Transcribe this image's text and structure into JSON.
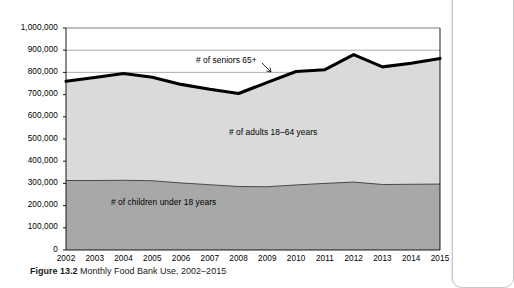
{
  "figure": {
    "caption_label": "Figure 13.2",
    "caption_text": "Monthly Food Bank Use, 2002–2015"
  },
  "chart_data": {
    "type": "area",
    "title": "",
    "xlabel": "",
    "ylabel": "",
    "categories": [
      "2002",
      "2003",
      "2004",
      "2005",
      "2006",
      "2007",
      "2008",
      "2009",
      "2010",
      "2011",
      "2012",
      "2013",
      "2014",
      "2015"
    ],
    "ylim": [
      0,
      1000000
    ],
    "ytick_labels": [
      "0",
      "100,000",
      "200,000",
      "300,000",
      "400,000",
      "500,000",
      "600,000",
      "700,000",
      "800,000",
      "900,000",
      "1,000,000"
    ],
    "ytick_values": [
      0,
      100000,
      200000,
      300000,
      400000,
      500000,
      600000,
      700000,
      800000,
      900000,
      1000000
    ],
    "grid": "horizontal",
    "legend_position": "inline-annotations",
    "stacked": true,
    "series": [
      {
        "name": "# of children under 18 years",
        "color": "#a8a8a8",
        "values": [
          313000,
          313000,
          314000,
          312000,
          302000,
          294000,
          286000,
          285000,
          293000,
          300000,
          306000,
          295000,
          296000,
          297000
        ]
      },
      {
        "name": "# of adults 18–64 years",
        "color": "#dadada",
        "values": [
          447000,
          460000,
          481000,
          466000,
          444000,
          430000,
          419000,
          470000,
          511000,
          512000,
          574000,
          530000,
          545000,
          566000
        ]
      },
      {
        "name": "# of seniors 65+",
        "color": "#000000",
        "values": [
          760000,
          777000,
          795000,
          778000,
          746000,
          724000,
          705000,
          755000,
          804000,
          812000,
          880000,
          825000,
          841000,
          863000
        ],
        "note": "thick black line = total monthly food bank users (top boundary)"
      }
    ],
    "annotations": [
      {
        "name": "seniors-label",
        "text": "# of seniors 65+",
        "arrow": true
      },
      {
        "name": "adults-label",
        "text": "# of adults 18–64 years",
        "arrow": false
      },
      {
        "name": "children-label",
        "text": "# of children under 18 years",
        "arrow": false
      }
    ]
  }
}
